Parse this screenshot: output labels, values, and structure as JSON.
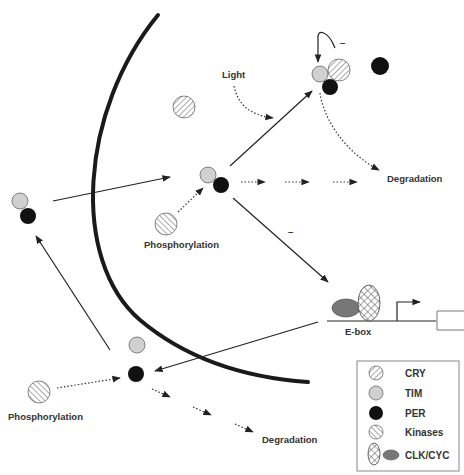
{
  "diagram": {
    "labels": {
      "light": "Light",
      "minus_top": "–",
      "minus_mid": "–",
      "degradation_top": "Degradation",
      "degradation_bottom": "Degradation",
      "phosphorylation_mid": "Phosphorylation",
      "phosphorylation_bottom": "Phosphorylation",
      "ebox": "E-box"
    },
    "legend": {
      "items": [
        {
          "key": "cry",
          "label": "CRY",
          "pattern": "diagonal-hatch",
          "color": "#ffffff"
        },
        {
          "key": "tim",
          "label": "TIM",
          "pattern": "solid",
          "color": "#d0d0d0"
        },
        {
          "key": "per",
          "label": "PER",
          "pattern": "solid",
          "color": "#111111"
        },
        {
          "key": "kinases",
          "label": "Kinases",
          "pattern": "diagonal-hatch-reverse",
          "color": "#ffffff"
        },
        {
          "key": "clkcyc",
          "label": "CLK/CYC",
          "pattern": "crosshatch + solid",
          "color": "#777777"
        }
      ]
    },
    "colors": {
      "line": "#222222",
      "tim_fill": "#d0d0d0",
      "per_fill": "#111111",
      "clk_fill": "#777777",
      "membrane": "#1a1a1a"
    }
  }
}
